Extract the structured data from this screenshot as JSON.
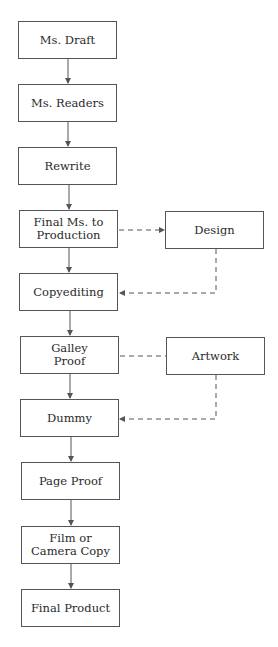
{
  "diagram": {
    "type": "publishing-process-flowchart",
    "nodes": [
      {
        "id": "ms_draft",
        "label": "Ms. Draft",
        "x": 18,
        "y": 21
      },
      {
        "id": "ms_readers",
        "label": "Ms. Readers",
        "x": 18,
        "y": 84
      },
      {
        "id": "rewrite",
        "label": "Rewrite",
        "x": 18,
        "y": 147
      },
      {
        "id": "final_ms",
        "label": "Final Ms. to\nProduction",
        "x": 19,
        "y": 210
      },
      {
        "id": "design",
        "label": "Design",
        "x": 165,
        "y": 211
      },
      {
        "id": "copyediting",
        "label": "Copyediting",
        "x": 19,
        "y": 273
      },
      {
        "id": "galley_proof",
        "label": "Galley\nProof",
        "x": 20,
        "y": 336
      },
      {
        "id": "artwork",
        "label": "Artwork",
        "x": 166,
        "y": 337
      },
      {
        "id": "dummy",
        "label": "Dummy",
        "x": 20,
        "y": 399
      },
      {
        "id": "page_proof",
        "label": "Page Proof",
        "x": 21,
        "y": 462
      },
      {
        "id": "film",
        "label": "Film or\nCamera Copy",
        "x": 21,
        "y": 526
      },
      {
        "id": "final_product",
        "label": "Final Product",
        "x": 21,
        "y": 589
      }
    ],
    "edges": [
      {
        "from": "ms_draft",
        "to": "ms_readers",
        "style": "solid",
        "arrow": true
      },
      {
        "from": "ms_readers",
        "to": "rewrite",
        "style": "solid",
        "arrow": true
      },
      {
        "from": "rewrite",
        "to": "final_ms",
        "style": "solid",
        "arrow": true
      },
      {
        "from": "final_ms",
        "to": "copyediting",
        "style": "solid",
        "arrow": true
      },
      {
        "from": "final_ms",
        "to": "design",
        "style": "dashed",
        "arrow": true
      },
      {
        "from": "design",
        "to": "copyediting",
        "style": "dashed",
        "arrow": true,
        "route": "down-then-left"
      },
      {
        "from": "copyediting",
        "to": "galley_proof",
        "style": "solid",
        "arrow": true
      },
      {
        "from": "galley_proof",
        "to": "artwork",
        "style": "dashed",
        "arrow": false
      },
      {
        "from": "galley_proof",
        "to": "dummy",
        "style": "solid",
        "arrow": true
      },
      {
        "from": "artwork",
        "to": "dummy",
        "style": "dashed",
        "arrow": true,
        "route": "down-then-left"
      },
      {
        "from": "dummy",
        "to": "page_proof",
        "style": "solid",
        "arrow": true
      },
      {
        "from": "page_proof",
        "to": "film",
        "style": "solid",
        "arrow": true
      },
      {
        "from": "film",
        "to": "final_product",
        "style": "solid",
        "arrow": true
      }
    ],
    "colors": {
      "line": "#555555",
      "text": "#2a2a2a",
      "background": "#ffffff"
    }
  }
}
